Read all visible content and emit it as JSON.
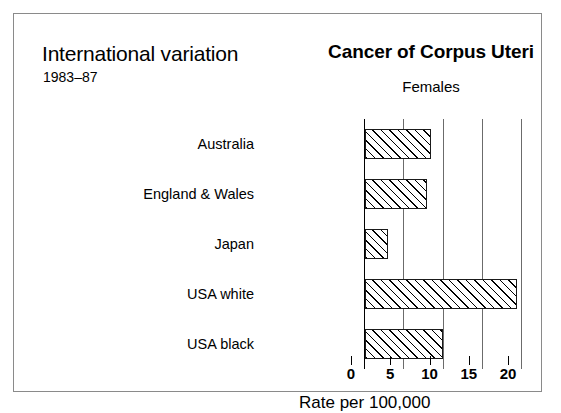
{
  "figure": {
    "left_header": {
      "title": "International variation",
      "subtitle": "1983–87"
    },
    "right_header": {
      "title": "Cancer of Corpus Uteri",
      "subtitle": "Females"
    }
  },
  "chart_data": {
    "type": "bar",
    "orientation": "horizontal",
    "title": "Cancer of Corpus Uteri",
    "subtitle": "Females",
    "annotations": [
      "International variation",
      "1983–87"
    ],
    "categories": [
      "Australia",
      "England & Wales",
      "Japan",
      "USA white",
      "USA black"
    ],
    "values": [
      8.5,
      8,
      3,
      19.5,
      10
    ],
    "xlabel": "Rate per 100,000",
    "ylabel": "",
    "xlim": [
      0,
      20
    ],
    "xticks": [
      0,
      5,
      10,
      15,
      20
    ],
    "xtick_labels": [
      "0",
      "5",
      "10",
      "15",
      "20"
    ],
    "grid": true,
    "grid_axis": "x",
    "legend": null,
    "bar_style": {
      "fill": "hatched",
      "hatch": "diagonal",
      "edge_color": "#000000",
      "face_color": "#ffffff"
    }
  }
}
